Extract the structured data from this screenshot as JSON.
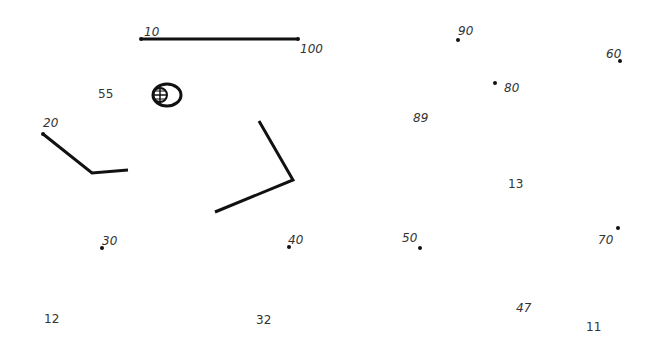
{
  "colors": {
    "background": "#ffffff",
    "stroke": "#111111",
    "label": "#333333"
  },
  "labels": [
    {
      "text": "10",
      "x": 144,
      "y": 26,
      "italic": true
    },
    {
      "text": "100",
      "x": 300,
      "y": 43,
      "italic": true
    },
    {
      "text": "55",
      "x": 98,
      "y": 88,
      "italic": false
    },
    {
      "text": "20",
      "x": 43,
      "y": 117,
      "italic": true
    },
    {
      "text": "90",
      "x": 458,
      "y": 25,
      "italic": true
    },
    {
      "text": "60",
      "x": 606,
      "y": 48,
      "italic": true
    },
    {
      "text": "80",
      "x": 504,
      "y": 82,
      "italic": true
    },
    {
      "text": "89",
      "x": 413,
      "y": 112,
      "italic": true
    },
    {
      "text": "13",
      "x": 508,
      "y": 178,
      "italic": false
    },
    {
      "text": "30",
      "x": 102,
      "y": 235,
      "italic": true
    },
    {
      "text": "40",
      "x": 288,
      "y": 234,
      "italic": true
    },
    {
      "text": "50",
      "x": 402,
      "y": 232,
      "italic": true
    },
    {
      "text": "70",
      "x": 598,
      "y": 234,
      "italic": true
    },
    {
      "text": "12",
      "x": 44,
      "y": 313,
      "italic": false
    },
    {
      "text": "32",
      "x": 256,
      "y": 314,
      "italic": false
    },
    {
      "text": "47",
      "x": 516,
      "y": 302,
      "italic": true
    },
    {
      "text": "11",
      "x": 586,
      "y": 321,
      "italic": false
    }
  ],
  "dots": [
    {
      "x": 141,
      "y": 39
    },
    {
      "x": 298,
      "y": 39
    },
    {
      "x": 43,
      "y": 134
    },
    {
      "x": 458,
      "y": 40
    },
    {
      "x": 620,
      "y": 61
    },
    {
      "x": 495,
      "y": 83
    },
    {
      "x": 102,
      "y": 248
    },
    {
      "x": 289,
      "y": 247
    },
    {
      "x": 420,
      "y": 248
    },
    {
      "x": 618,
      "y": 228
    }
  ]
}
